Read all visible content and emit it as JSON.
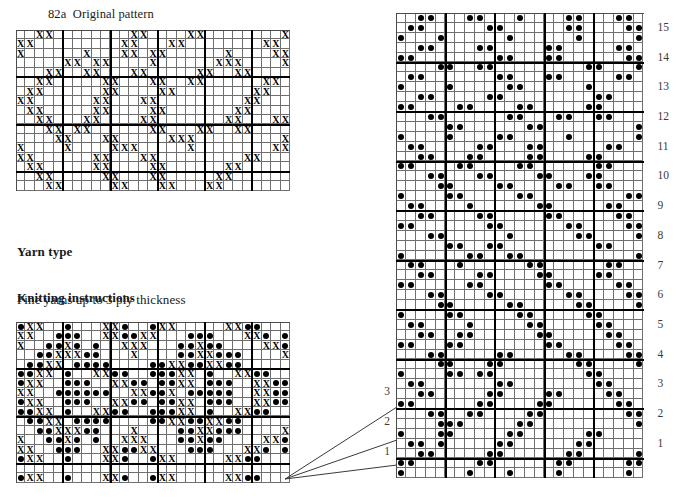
{
  "page": {
    "width": 698,
    "height": 499,
    "background": "#ffffff",
    "ink": "#000000",
    "gridline_color": "#6f6f6f",
    "majorline_color": "#000000"
  },
  "title": "82a  Original pattern",
  "yarn": {
    "heading": "Yarn type",
    "body": "Fine yarns up to 3 ply thickness"
  },
  "knitting": {
    "heading": "Knitting instructions",
    "body": "See page 97"
  },
  "symbols": {
    "cross": "X",
    "dot": "●",
    "cross_name": "cross-symbol",
    "dot_name": "dot-symbol"
  },
  "chart_data": [
    {
      "id": "original-pattern-chart",
      "type": "heatmap",
      "title": "82a  Original pattern",
      "note": "Original cross-stitch style pattern chart. Value 1 = X mark, 0 = empty cell.",
      "cols": 29,
      "rows": 17,
      "cell": 9.45,
      "origin": [
        16,
        30
      ],
      "major_every": 5,
      "legend": [
        {
          "value": 1,
          "symbol": "X",
          "label": "cross"
        },
        {
          "value": 0,
          "symbol": "",
          "label": "empty"
        }
      ],
      "rowlabels": [],
      "matrix": [
        "00110000000011000011000000001",
        "11000000000110001100000000110",
        "10000001000110110000001000011",
        "00000110110000100000011100001",
        "00011001100011000001100110000",
        "00110000011000110011000000110",
        "01100000011000011000000001100",
        "11000000110001100000000011000",
        "01100000110000110000000110000",
        "00110001100001100000001100011",
        "00011011000000110001100110000",
        "00001100011000001110000000001",
        "10000100001110000010000000011",
        "11000000110001100000000011000",
        "01100000110000110000001100000",
        "00110000011000110000011000000",
        "00011000001100011000110000000"
      ]
    },
    {
      "id": "working-pattern-chart",
      "type": "heatmap",
      "title": "",
      "note": "Lower-left working chart combining X marks (knit symbol) and filled dots (purl / colour symbol). 2 = dot, 1 = X, 0 = empty.",
      "cols": 29,
      "rows": 17,
      "cell": 9.45,
      "origin": [
        16,
        322
      ],
      "major_every": 5,
      "legend": [
        {
          "value": 2,
          "symbol": "●",
          "label": "dot"
        },
        {
          "value": 1,
          "symbol": "X",
          "label": "cross"
        },
        {
          "value": 0,
          "symbol": "",
          "label": "empty"
        }
      ],
      "rowlabels": [],
      "matrix": [
        "21100200011200211000001122000",
        "11002220011221100022200011202",
        "10022120200111000221220000112",
        "00221112200010000221122200001",
        "02211022220000221122112200000",
        "22110200112200222110200112200",
        "21100222001122022110222001122",
        "11002222220011221022222001122",
        "21100222001122022110222001122",
        "22110200112200222110200112200",
        "02211022220000221122112200000",
        "00221112200010000221122200001",
        "10022120200111000221220000112",
        "11002220011221100022200011202",
        "21100200011200211000001122000",
        "00000000000000000000000000000",
        "21100200011200211000001122000"
      ]
    },
    {
      "id": "knitting-machine-chart",
      "type": "heatmap",
      "title": "",
      "note": "Right-hand machine-knitting punchcard chart. 1 = filled dot (needle selected), 0 = empty.",
      "cols": 25,
      "rows": 47,
      "cell": 9.9,
      "origin": [
        396,
        13
      ],
      "major_every": 5,
      "legend": [
        {
          "value": 1,
          "symbol": "●",
          "label": "dot"
        },
        {
          "value": 0,
          "symbol": "",
          "label": "empty"
        }
      ],
      "rowlabels_right": [
        15,
        14,
        13,
        12,
        11,
        10,
        9,
        8,
        7,
        6,
        5,
        4,
        3,
        2,
        1
      ],
      "rowlabels_left": [
        3,
        2,
        1
      ],
      "matrix": [
        "0011000110001000011000110",
        "0110000001100000011000011",
        "1000100000010000001000001",
        "0011000011000001100000110",
        "1100000000110001100000011",
        "0000110011000000000110001",
        "0110000000110001100000110",
        "1000010000011000000100000",
        "0011000001100000000011000",
        "1100001100001100000110000",
        "0001100000011000110011000",
        "0000011000000110000000001",
        "1000010000110000010000001",
        "0110000011000110000001100",
        "0011000110000110000110000",
        "1100001100001100000011000",
        "0001100011000011000110000",
        "0000110000110000110011000",
        "1000011000001100000000011",
        "0110000100000011000001100",
        "0011000011000001100000110",
        "1100000001100000011000011",
        "0001100000010000001100001",
        "0000011001100000000011000",
        "1000000110011000000000001",
        "0110001000000110000001100",
        "0011000011000011000011000",
        "1100000110000001100000110",
        "0001100001100000011000011",
        "0000110000011000001100001",
        "1000011000001100000110000",
        "0110000100000110000011000",
        "0011001100000011000001100",
        "1100011000000001100000110",
        "0001100000110000011000011",
        "0000110001100000001100001",
        "1000011011000000000110000",
        "0110000000110000000011000",
        "0011000001100001100001100",
        "1100000011000011000000110",
        "0001100110000110000000011",
        "0000111000001100000000001",
        "1000110000011000000110000",
        "0110100000110000001100000",
        "0011000001100000011000001",
        "1100000011000000110000011",
        "1000000100010000100000010"
      ]
    }
  ],
  "connectors": {
    "name": "leader-lines",
    "count": 3,
    "color": "#3a3a3a",
    "targets": [
      "1",
      "2",
      "3"
    ]
  }
}
